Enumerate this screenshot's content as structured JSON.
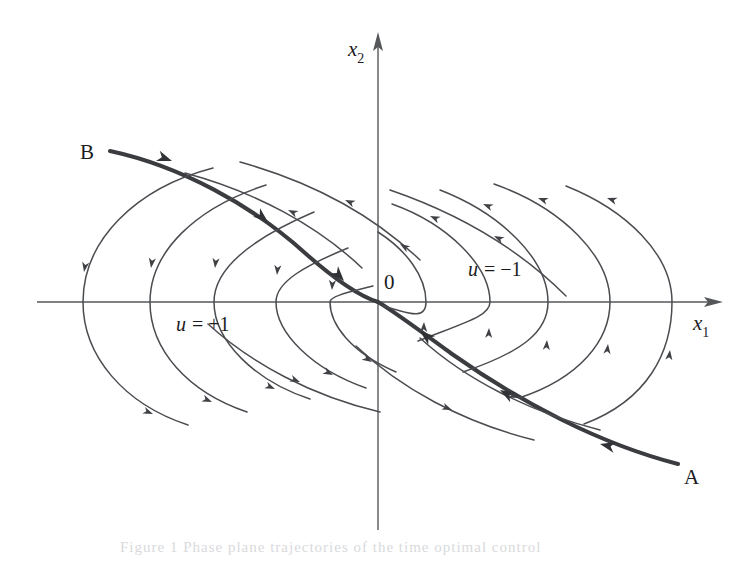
{
  "figure": {
    "kind": "phase-plane-diagram",
    "background_color": "#ffffff",
    "ink_color": "#4a4c50",
    "axes": {
      "x_axis_label": "x",
      "x_axis_subscript": "1",
      "y_axis_label": "x",
      "y_axis_subscript": "2",
      "origin_label": "0"
    },
    "annotations": {
      "control_positive_u": "u",
      "control_positive_eq": "= +1",
      "control_negative_u": "u",
      "control_negative_eq": "= −1",
      "point_a": "A",
      "point_b": "B"
    },
    "bleed_text": "Figure 1   Phase plane trajectories of the time optimal control"
  },
  "chart_data": {
    "type": "line",
    "title": "",
    "subtitle": "",
    "xlabel": "x1",
    "ylabel": "x2",
    "grid": false,
    "legend": "inline-annotations",
    "axis_pixel_origin": [
      378,
      302
    ],
    "xlim_px": [
      37,
      723
    ],
    "ylim_px": [
      32,
      530
    ],
    "annotations": [
      {
        "text": "x2",
        "x_px": 358,
        "y_px": 48,
        "role": "y-axis-label"
      },
      {
        "text": "x1",
        "x_px": 700,
        "y_px": 322,
        "role": "x-axis-label"
      },
      {
        "text": "0",
        "x_px": 388,
        "y_px": 287,
        "role": "origin-label"
      },
      {
        "text": "u = +1",
        "x_px": 176,
        "y_px": 330,
        "role": "control-region-label"
      },
      {
        "text": "u = −1",
        "x_px": 468,
        "y_px": 275,
        "role": "control-region-label"
      },
      {
        "text": "B",
        "x_px": 85,
        "y_px": 153,
        "role": "terminal-point-label"
      },
      {
        "text": "A",
        "x_px": 688,
        "y_px": 478,
        "role": "terminal-point-label"
      }
    ],
    "series": [
      {
        "name": "switching-curve-B-branch",
        "style": "thick",
        "path": "M 110 151 C 180 166 252 205 305 253 C 340 284 362 297 378 302",
        "arrows": [
          {
            "x": 172,
            "y": 161,
            "angle": 20
          },
          {
            "x": 268,
            "y": 222,
            "angle": 40
          },
          {
            "x": 344,
            "y": 281,
            "angle": 48
          }
        ]
      },
      {
        "name": "switching-curve-A-branch",
        "style": "thick",
        "path": "M 678 464 C 600 444 520 402 452 354 C 415 327 392 310 378 302",
        "arrows": [
          {
            "x": 600,
            "y": 444,
            "angle": 193
          },
          {
            "x": 500,
            "y": 390,
            "angle": 210
          },
          {
            "x": 420,
            "y": 331,
            "angle": 219
          }
        ]
      },
      {
        "name": "u-plus-1-arc-1",
        "style": "thin",
        "path": "M 213 168 C 136 188 83 240 83 302 C 83 356 124 404 188 425",
        "arrows": [
          {
            "x": 84,
            "y": 272,
            "angle": 100
          },
          {
            "x": 153,
            "y": 414,
            "angle": 22
          }
        ]
      },
      {
        "name": "u-plus-1-arc-2",
        "style": "thin",
        "path": "M 266 185 C 195 208 150 252 150 302 C 150 350 188 392 247 412",
        "arrows": [
          {
            "x": 151,
            "y": 268,
            "angle": 98
          },
          {
            "x": 212,
            "y": 402,
            "angle": 23
          }
        ]
      },
      {
        "name": "u-plus-1-arc-3",
        "style": "thin",
        "path": "M 314 212 C 253 238 214 268 214 302 C 214 341 255 381 310 399",
        "arrows": [
          {
            "x": 215,
            "y": 268,
            "angle": 96
          },
          {
            "x": 275,
            "y": 389,
            "angle": 24
          }
        ]
      },
      {
        "name": "u-plus-1-arc-4",
        "style": "thin",
        "path": "M 348 248 C 304 266 276 282 276 302 C 276 333 312 369 366 388",
        "arrows": [
          {
            "x": 277,
            "y": 275,
            "angle": 95
          },
          {
            "x": 333,
            "y": 375,
            "angle": 27
          }
        ]
      },
      {
        "name": "u-plus-1-arc-5",
        "style": "thin",
        "path": "M 373 286 C 350 292 330 296 330 302 C 330 324 350 352 396 372",
        "arrows": [
          {
            "x": 332,
            "y": 290,
            "angle": 93
          },
          {
            "x": 372,
            "y": 362,
            "angle": 32
          }
        ]
      },
      {
        "name": "u-minus-1-arc-1",
        "style": "thin",
        "path": "M 383 306 C 406 312 426 322 426 302 C 426 276 406 250 378 232",
        "arrows": [
          {
            "x": 424,
            "y": 322,
            "angle": 272
          },
          {
            "x": 400,
            "y": 244,
            "angle": 212
          }
        ]
      },
      {
        "name": "u-minus-1-arc-2",
        "style": "thin",
        "path": "M 418 341 C 466 322 490 316 490 302 C 490 266 448 224 392 204",
        "arrows": [
          {
            "x": 489,
            "y": 328,
            "angle": 272
          },
          {
            "x": 430,
            "y": 216,
            "angle": 204
          }
        ]
      },
      {
        "name": "u-minus-1-arc-3",
        "style": "thin",
        "path": "M 463 372 C 522 352 548 332 548 302 C 548 260 502 214 440 190",
        "arrows": [
          {
            "x": 547,
            "y": 340,
            "angle": 274
          },
          {
            "x": 483,
            "y": 204,
            "angle": 202
          }
        ]
      },
      {
        "name": "u-minus-1-arc-4",
        "style": "thin",
        "path": "M 519 398 C 580 378 610 340 610 302 C 610 256 562 208 494 184",
        "arrows": [
          {
            "x": 608,
            "y": 344,
            "angle": 276
          },
          {
            "x": 538,
            "y": 198,
            "angle": 200
          }
        ]
      },
      {
        "name": "u-minus-1-arc-5",
        "style": "thin",
        "path": "M 584 424 C 648 400 672 352 672 302 C 672 254 626 210 566 186",
        "arrows": [
          {
            "x": 670,
            "y": 350,
            "angle": 277
          },
          {
            "x": 607,
            "y": 198,
            "angle": 199
          }
        ]
      },
      {
        "name": "u-minus-1-outer-upper-1",
        "style": "thin",
        "path": "M 185 173 C 256 192 318 226 362 268",
        "arrows": [
          {
            "x": 288,
            "y": 210,
            "angle": 205
          }
        ]
      },
      {
        "name": "u-minus-1-outer-upper-2",
        "style": "thin",
        "path": "M 240 162 C 312 182 374 216 420 260",
        "arrows": [
          {
            "x": 345,
            "y": 200,
            "angle": 204
          }
        ]
      },
      {
        "name": "u-minus-1-outer-upper-3",
        "style": "thin",
        "path": "M 390 190 C 460 214 520 250 566 296",
        "arrows": [
          {
            "x": 494,
            "y": 236,
            "angle": 206
          }
        ]
      },
      {
        "name": "u-plus-1-outer-lower-1",
        "style": "thin",
        "path": "M 600 430 C 530 412 466 380 420 338",
        "arrows": [
          {
            "x": 518,
            "y": 398,
            "angle": 22
          }
        ]
      },
      {
        "name": "u-plus-1-outer-lower-2",
        "style": "thin",
        "path": "M 534 440 C 462 422 400 388 356 346",
        "arrows": [
          {
            "x": 452,
            "y": 410,
            "angle": 22
          }
        ]
      },
      {
        "name": "u-plus-1-outer-lower-3",
        "style": "thin",
        "path": "M 380 412 C 312 396 252 364 208 324",
        "arrows": [
          {
            "x": 300,
            "y": 382,
            "angle": 22
          }
        ]
      }
    ]
  }
}
